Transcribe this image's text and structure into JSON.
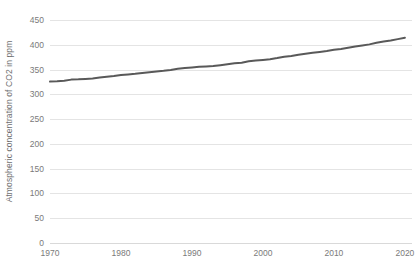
{
  "chart_data": {
    "type": "line",
    "title": "",
    "subtitle": "",
    "xlabel": "",
    "ylabel": "Atmospheric concentration of CO2 in ppm",
    "xlim": [
      1970,
      2021
    ],
    "ylim": [
      0,
      450
    ],
    "grid": true,
    "grid_axis": "y",
    "legend": false,
    "legend_position": "none",
    "line_color": "#595959",
    "line_width": 2,
    "marker": "none",
    "y_ticks": [
      0,
      50,
      100,
      150,
      200,
      250,
      300,
      350,
      400,
      450
    ],
    "y_tick_labels": [
      "0",
      "50",
      "100",
      "150",
      "200",
      "250",
      "300",
      "350",
      "400",
      "450"
    ],
    "x_ticks": [
      1970,
      1980,
      1990,
      2000,
      2010,
      2020
    ],
    "x_tick_labels": [
      "1970",
      "1980",
      "1990",
      "2000",
      "2010",
      "2020"
    ],
    "series": [
      {
        "name": "Atmospheric CO2",
        "x": [
          1970,
          1971,
          1972,
          1973,
          1974,
          1975,
          1976,
          1977,
          1978,
          1979,
          1980,
          1981,
          1982,
          1983,
          1984,
          1985,
          1986,
          1987,
          1988,
          1989,
          1990,
          1991,
          1992,
          1993,
          1994,
          1995,
          1996,
          1997,
          1998,
          1999,
          2000,
          2001,
          2002,
          2003,
          2004,
          2005,
          2006,
          2007,
          2008,
          2009,
          2010,
          2011,
          2012,
          2013,
          2014,
          2015,
          2016,
          2017,
          2018,
          2019,
          2020
        ],
        "values": [
          325.7,
          326.3,
          327.5,
          329.7,
          330.2,
          331.1,
          332.0,
          333.8,
          335.4,
          336.8,
          338.8,
          340.1,
          341.4,
          343.0,
          344.6,
          346.0,
          347.4,
          349.2,
          351.6,
          353.1,
          354.4,
          355.6,
          356.4,
          357.1,
          358.8,
          360.8,
          362.6,
          363.8,
          366.6,
          368.3,
          369.5,
          371.0,
          373.2,
          375.8,
          377.5,
          379.8,
          381.9,
          383.8,
          385.6,
          387.4,
          389.9,
          391.6,
          393.9,
          396.5,
          398.6,
          400.8,
          404.2,
          406.5,
          408.5,
          411.4,
          414.2
        ]
      }
    ]
  },
  "axis": {
    "y_title": "Atmospheric concentration of CO2 in ppm"
  }
}
